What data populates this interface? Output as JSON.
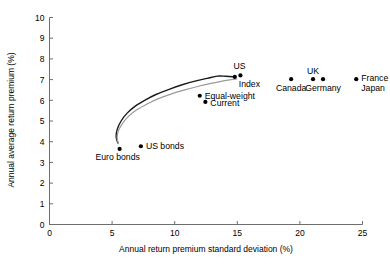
{
  "chart_data": {
    "type": "scatter",
    "title": "",
    "xlabel": "Annual return premium standard deviation (%)",
    "ylabel": "Annual average return premium (%)",
    "xlim": [
      0,
      25
    ],
    "ylim": [
      0,
      10
    ],
    "xticks": [
      0,
      5,
      10,
      15,
      20,
      25
    ],
    "yticks": [
      0,
      1,
      2,
      3,
      4,
      5,
      6,
      7,
      8,
      9,
      10
    ],
    "xtick_labels": [
      "0",
      "5",
      "10",
      "15",
      "20",
      "25"
    ],
    "ytick_labels": [
      "0",
      "1",
      "2",
      "3",
      "4",
      "5",
      "6",
      "7",
      "8",
      "9",
      "10"
    ],
    "grid": false,
    "legend": "none",
    "points": [
      {
        "label": "Euro bonds",
        "x": 5.6,
        "y": 3.65,
        "label_dx": -2,
        "label_dy": 11,
        "label_anchor": "middle"
      },
      {
        "label": "US bonds",
        "x": 7.3,
        "y": 3.78,
        "label_dx": 5,
        "label_dy": 3,
        "label_anchor": "start"
      },
      {
        "label": "Equal-weight",
        "x": 12.0,
        "y": 6.22,
        "label_dx": 5,
        "label_dy": 3,
        "label_anchor": "start"
      },
      {
        "label": "Current",
        "x": 12.45,
        "y": 5.92,
        "label_dx": 5,
        "label_dy": 4,
        "label_anchor": "start"
      },
      {
        "label": "Index",
        "x": 14.8,
        "y": 7.13,
        "label_dx": 4,
        "label_dy": 10,
        "label_anchor": "start"
      },
      {
        "label": "US",
        "x": 15.25,
        "y": 7.2,
        "label_dx": -1,
        "label_dy": -6,
        "label_anchor": "middle"
      },
      {
        "label": "Canada",
        "x": 19.3,
        "y": 7.02,
        "label_dx": 0,
        "label_dy": 12,
        "label_anchor": "middle"
      },
      {
        "label": "UK",
        "x": 21.05,
        "y": 7.02,
        "label_dx": 0,
        "label_dy": -5,
        "label_anchor": "middle"
      },
      {
        "label": "Germany",
        "x": 21.85,
        "y": 7.02,
        "label_dx": 0,
        "label_dy": 12,
        "label_anchor": "middle"
      },
      {
        "label": "France",
        "x": 24.5,
        "y": 7.02,
        "label_dx": 5,
        "label_dy": 2,
        "label_anchor": "start"
      },
      {
        "label": "Japan",
        "x": 24.5,
        "y": 7.02,
        "label_dx": 5,
        "label_dy": 12,
        "label_anchor": "start"
      }
    ],
    "curves": [
      {
        "name": "efficient-frontier-black",
        "color": "#1a1a1a",
        "width": 1.4,
        "points": [
          [
            5.45,
            3.95
          ],
          [
            5.32,
            4.25
          ],
          [
            5.42,
            4.62
          ],
          [
            5.72,
            5.0
          ],
          [
            6.2,
            5.38
          ],
          [
            6.85,
            5.72
          ],
          [
            7.6,
            6.0
          ],
          [
            8.5,
            6.28
          ],
          [
            9.5,
            6.52
          ],
          [
            10.6,
            6.75
          ],
          [
            11.7,
            6.94
          ],
          [
            12.6,
            7.06
          ],
          [
            13.4,
            7.17
          ],
          [
            14.1,
            7.16
          ],
          [
            14.85,
            7.13
          ]
        ]
      },
      {
        "name": "efficient-frontier-gray",
        "color": "#9a9a9a",
        "width": 1.2,
        "points": [
          [
            5.5,
            3.9
          ],
          [
            5.4,
            4.2
          ],
          [
            5.52,
            4.55
          ],
          [
            5.85,
            4.9
          ],
          [
            6.35,
            5.25
          ],
          [
            7.0,
            5.55
          ],
          [
            7.8,
            5.82
          ],
          [
            8.7,
            6.08
          ],
          [
            9.7,
            6.3
          ],
          [
            10.8,
            6.5
          ],
          [
            11.9,
            6.68
          ],
          [
            12.9,
            6.82
          ],
          [
            13.8,
            6.93
          ],
          [
            14.4,
            6.99
          ],
          [
            14.95,
            7.03
          ]
        ]
      }
    ],
    "colors": {
      "axis": "#6e6e6e",
      "marker": "#000000",
      "curve_primary": "#1a1a1a",
      "curve_secondary": "#9a9a9a",
      "background": "#ffffff"
    }
  }
}
